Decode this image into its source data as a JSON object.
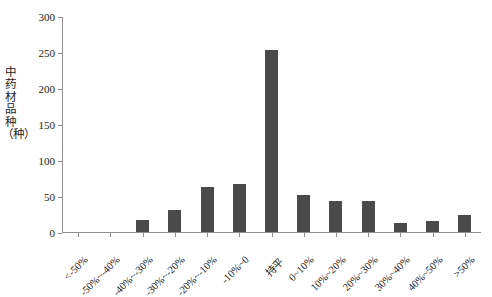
{
  "chart_data": {
    "type": "bar",
    "title": "",
    "subtitle": "",
    "xlabel": "",
    "ylabel": "中药材品种（种）",
    "ylim": [
      0,
      300
    ],
    "yticks": [
      0,
      50,
      100,
      150,
      200,
      250,
      300
    ],
    "ytick_labels": [
      "0",
      "50",
      "100",
      "150",
      "200",
      "250",
      "300"
    ],
    "grid": false,
    "legend": null,
    "legend_position": "none",
    "bar_color": "#4a4a4a",
    "axis_color": "#8f8f8f",
    "categories": [
      "<-50%",
      "-50%~-40%",
      "-40%~-30%",
      "-30%~-20%",
      "-20%~-10%",
      "-10%~0",
      "持平",
      "0~10%",
      "10%~20%",
      "20%~30%",
      "30%~40%",
      "40%~50%",
      ">50%"
    ],
    "values": [
      0,
      0,
      17,
      30,
      63,
      66,
      253,
      52,
      43,
      43,
      13,
      15,
      24
    ],
    "series": [
      {
        "name": "中药材品种",
        "values": [
          0,
          0,
          17,
          30,
          63,
          66,
          253,
          52,
          43,
          43,
          13,
          15,
          24
        ]
      }
    ],
    "annotations": []
  }
}
